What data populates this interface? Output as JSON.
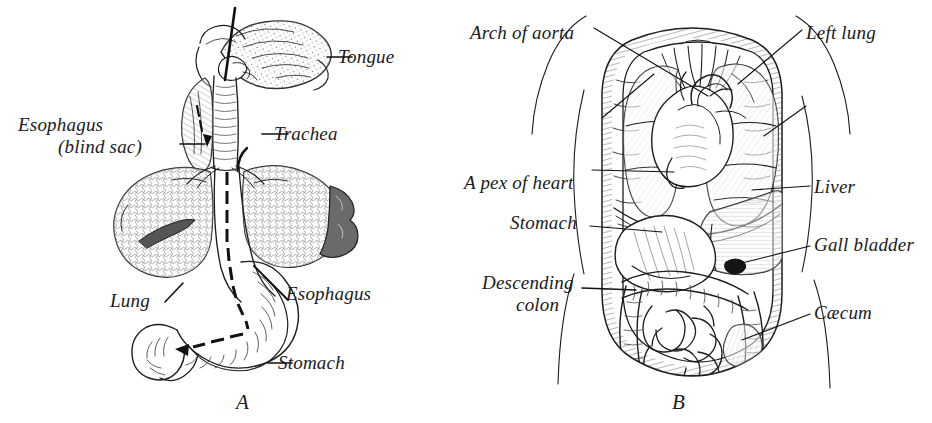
{
  "figure": {
    "background_color": "#ffffff",
    "ink_color": "#1a1a1a",
    "width": 932,
    "height": 423
  },
  "panel_a": {
    "caption": "A",
    "labels": {
      "tongue": "Tongue",
      "esophagus_blind_sac_line1": "Esophagus",
      "esophagus_blind_sac_line2": "(blind sac)",
      "trachea": "Trachea",
      "lung": "Lung",
      "esophagus": "Esophagus",
      "stomach": "Stomach"
    }
  },
  "panel_b": {
    "caption": "B",
    "labels": {
      "arch_of_aorta": "Arch of aorta",
      "left_lung": "Left lung",
      "apex_of_heart": "A pex of heart",
      "liver": "Liver",
      "stomach": "Stomach",
      "gall_bladder": "Gall bladder",
      "descending_colon_line1": "Descending",
      "descending_colon_line2": "colon",
      "caecum": "Cæcum"
    }
  }
}
